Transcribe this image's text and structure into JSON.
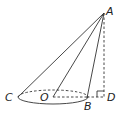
{
  "diagram": {
    "type": "geometry",
    "points": {
      "A": {
        "label": "A",
        "x": 104,
        "y": 13
      },
      "C": {
        "label": "C",
        "x": 18,
        "y": 97
      },
      "O": {
        "label": "O",
        "x": 53,
        "y": 97
      },
      "B": {
        "label": "B",
        "x": 87,
        "y": 98
      },
      "D": {
        "label": "D",
        "x": 104,
        "y": 97
      }
    },
    "segments": [
      {
        "from": "A",
        "to": "C",
        "style": "solid"
      },
      {
        "from": "A",
        "to": "O",
        "style": "solid"
      },
      {
        "from": "A",
        "to": "B",
        "style": "solid"
      },
      {
        "from": "A",
        "to": "D",
        "style": "dashed"
      },
      {
        "from": "O",
        "to": "B",
        "style": "dashed"
      },
      {
        "from": "B",
        "to": "D",
        "style": "dashed"
      }
    ],
    "base_ellipse": {
      "cx": 53,
      "cy": 97,
      "rx": 35,
      "ry": 7,
      "front": "solid",
      "back": "dashed"
    },
    "right_angle_at": "D",
    "labels": [
      "A",
      "C",
      "O",
      "B",
      "D"
    ]
  }
}
